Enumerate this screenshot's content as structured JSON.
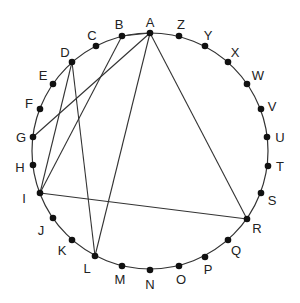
{
  "diagram": {
    "type": "circle-chords",
    "circle": {
      "cx": 150,
      "cy": 151,
      "r": 118,
      "stroke": "#333333"
    },
    "points": [
      {
        "id": "A",
        "x": 150,
        "y": 33,
        "lx": 150,
        "ly": 22
      },
      {
        "id": "B",
        "x": 122,
        "y": 36,
        "lx": 119,
        "ly": 24
      },
      {
        "id": "C",
        "x": 96,
        "y": 46,
        "lx": 92,
        "ly": 35
      },
      {
        "id": "D",
        "x": 72,
        "y": 62,
        "lx": 65,
        "ly": 52
      },
      {
        "id": "E",
        "x": 53,
        "y": 84,
        "lx": 43,
        "ly": 75
      },
      {
        "id": "F",
        "x": 40,
        "y": 109,
        "lx": 29,
        "ly": 103
      },
      {
        "id": "G",
        "x": 33,
        "y": 137,
        "lx": 21,
        "ly": 137
      },
      {
        "id": "H",
        "x": 33,
        "y": 165,
        "lx": 20,
        "ly": 167
      },
      {
        "id": "I",
        "x": 40,
        "y": 193,
        "lx": 24,
        "ly": 198
      },
      {
        "id": "J",
        "x": 53,
        "y": 218,
        "lx": 41,
        "ly": 230
      },
      {
        "id": "K",
        "x": 72,
        "y": 240,
        "lx": 62,
        "ly": 250
      },
      {
        "id": "L",
        "x": 95,
        "y": 256,
        "lx": 87,
        "ly": 268
      },
      {
        "id": "M",
        "x": 122,
        "y": 266,
        "lx": 120,
        "ly": 279
      },
      {
        "id": "N",
        "x": 150,
        "y": 270,
        "lx": 150,
        "ly": 284
      },
      {
        "id": "O",
        "x": 179,
        "y": 266,
        "lx": 181,
        "ly": 279
      },
      {
        "id": "P",
        "x": 205,
        "y": 257,
        "lx": 208,
        "ly": 269
      },
      {
        "id": "Q",
        "x": 228,
        "y": 240,
        "lx": 236,
        "ly": 250
      },
      {
        "id": "R",
        "x": 247,
        "y": 219,
        "lx": 257,
        "ly": 228
      },
      {
        "id": "S",
        "x": 261,
        "y": 193,
        "lx": 272,
        "ly": 200
      },
      {
        "id": "T",
        "x": 268,
        "y": 166,
        "lx": 280,
        "ly": 166
      },
      {
        "id": "U",
        "x": 267,
        "y": 137,
        "lx": 280,
        "ly": 137
      },
      {
        "id": "V",
        "x": 261,
        "y": 109,
        "lx": 272,
        "ly": 106
      },
      {
        "id": "W",
        "x": 247,
        "y": 84,
        "lx": 258,
        "ly": 75
      },
      {
        "id": "X",
        "x": 228,
        "y": 62,
        "lx": 235,
        "ly": 52
      },
      {
        "id": "Y",
        "x": 205,
        "y": 46,
        "lx": 208,
        "ly": 35
      },
      {
        "id": "Z",
        "x": 179,
        "y": 36,
        "lx": 181,
        "ly": 24
      }
    ],
    "chords": [
      [
        "A",
        "B"
      ],
      [
        "A",
        "G"
      ],
      [
        "A",
        "L"
      ],
      [
        "A",
        "R"
      ],
      [
        "B",
        "I"
      ],
      [
        "D",
        "I"
      ],
      [
        "D",
        "L"
      ],
      [
        "I",
        "R"
      ]
    ]
  }
}
